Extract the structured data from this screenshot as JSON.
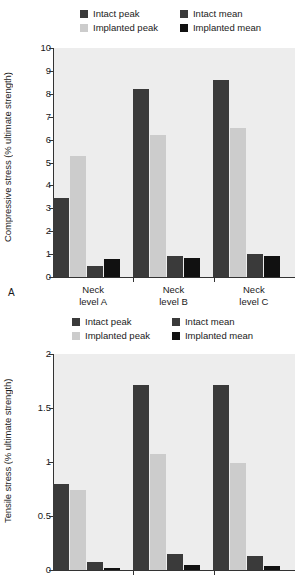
{
  "figure": {
    "panel_a_letter": "A",
    "legend": [
      {
        "label": "Intact peak",
        "color": "#3a3a3a",
        "icon": "legend-swatch"
      },
      {
        "label": "Intact mean",
        "color": "#3a3a3a",
        "icon": "legend-swatch"
      },
      {
        "label": "Implanted peak",
        "color": "#cccccc",
        "icon": "legend-swatch"
      },
      {
        "label": "Implanted mean",
        "color": "#111111",
        "icon": "legend-swatch"
      }
    ]
  },
  "chart_data": [
    {
      "type": "bar",
      "panel": "A",
      "title": "",
      "xlabel": "",
      "ylabel": "Compressive stress (% ultimate strength)",
      "categories": [
        "Neck\nlevel A",
        "Neck\nlevel B",
        "Neck\nlevel C"
      ],
      "yticks": [
        0,
        1,
        2,
        3,
        4,
        5,
        6,
        7,
        8,
        9,
        10
      ],
      "ytick_labels": [
        "0",
        "1",
        "2",
        "3",
        "4",
        "5",
        "6",
        "7",
        "8",
        "9",
        "10"
      ],
      "ylim": [
        0,
        10
      ],
      "grid": false,
      "legend_position": "top",
      "series": [
        {
          "name": "Intact peak",
          "color": "#3a3a3a",
          "values": [
            3.45,
            8.2,
            8.6
          ]
        },
        {
          "name": "Implanted peak",
          "color": "#cccccc",
          "values": [
            5.3,
            6.2,
            6.5
          ]
        },
        {
          "name": "Intact mean",
          "color": "#3a3a3a",
          "values": [
            0.5,
            0.9,
            1.0
          ]
        },
        {
          "name": "Implanted mean",
          "color": "#111111",
          "values": [
            0.8,
            0.85,
            0.9
          ]
        }
      ]
    },
    {
      "type": "bar",
      "panel": "B",
      "title": "",
      "xlabel": "",
      "ylabel": "Tensile stress (% ultimate strength)",
      "categories": [
        "",
        "",
        ""
      ],
      "yticks": [
        0,
        0.5,
        1,
        1.5,
        2
      ],
      "ytick_labels": [
        "0",
        "0.5",
        "1",
        "1.5",
        "2"
      ],
      "ylim": [
        0,
        2
      ],
      "grid": false,
      "legend_position": "top",
      "series": [
        {
          "name": "Intact peak",
          "color": "#3a3a3a",
          "values": [
            0.8,
            1.71,
            1.71
          ]
        },
        {
          "name": "Implanted peak",
          "color": "#cccccc",
          "values": [
            0.74,
            1.07,
            0.99
          ]
        },
        {
          "name": "Intact mean",
          "color": "#3a3a3a",
          "values": [
            0.07,
            0.15,
            0.13
          ]
        },
        {
          "name": "Implanted mean",
          "color": "#111111",
          "values": [
            0.02,
            0.05,
            0.04
          ]
        }
      ]
    }
  ]
}
